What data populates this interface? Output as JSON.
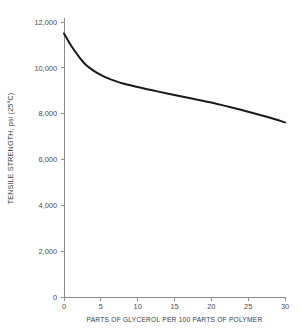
{
  "chart_data": {
    "type": "line",
    "title": "",
    "xlabel": "PARTS OF GLYCEROL PER 100 PARTS OF POLYMER",
    "ylabel": "TENSILE STRENGTH, psi (25°C)",
    "xlim": [
      0,
      30
    ],
    "ylim": [
      0,
      12000
    ],
    "grid": false,
    "legend": null,
    "x_ticks": [
      0,
      5,
      10,
      15,
      20,
      25,
      30
    ],
    "x_tick_labels": [
      "0",
      "5",
      "10",
      "15",
      "20",
      "25",
      "30"
    ],
    "y_ticks": [
      0,
      2000,
      4000,
      6000,
      8000,
      10000,
      12000
    ],
    "y_tick_labels": [
      "0",
      "2,000",
      "4,000",
      "6,000",
      "8,000",
      "10,000",
      "12,000"
    ],
    "series": [
      {
        "name": "Tensile strength",
        "color": "#1a1a1a",
        "line_width": 2,
        "x": [
          0,
          1,
          2,
          3,
          4,
          5,
          6,
          7,
          8,
          9,
          10,
          12,
          14,
          16,
          18,
          20,
          22,
          24,
          26,
          28,
          30
        ],
        "values": [
          11500,
          10950,
          10500,
          10120,
          9880,
          9690,
          9540,
          9420,
          9320,
          9240,
          9160,
          9020,
          8880,
          8750,
          8620,
          8490,
          8330,
          8170,
          8000,
          7820,
          7620
        ]
      }
    ]
  },
  "axes": {
    "axis_color": "#8c8c8c",
    "tick_color": "#8c8c8c",
    "label_color": "#4a4a4a"
  }
}
